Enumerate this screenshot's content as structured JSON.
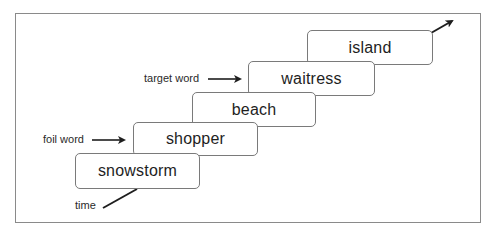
{
  "diagram": {
    "type": "sequence-staircase",
    "words": [
      {
        "text": "snowstorm",
        "role": "item"
      },
      {
        "text": "shopper",
        "role": "foil"
      },
      {
        "text": "beach",
        "role": "item"
      },
      {
        "text": "waitress",
        "role": "target"
      },
      {
        "text": "island",
        "role": "item"
      }
    ],
    "labels": {
      "foil": "foil word",
      "target": "target word",
      "time": "time"
    },
    "icons": {
      "foil_arrow": "arrow-right-icon",
      "target_arrow": "arrow-right-icon",
      "time_arrow": "arrow-up-right-icon"
    },
    "colors": {
      "box_border": "#7a7a7a",
      "frame_border": "#8a8a8a",
      "ink": "#1e1e1e"
    }
  }
}
